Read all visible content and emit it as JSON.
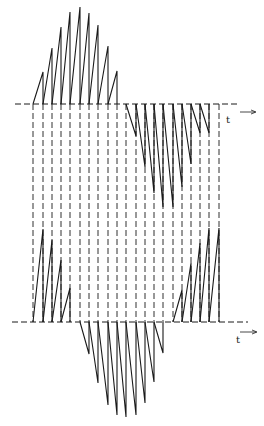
{
  "diagram": {
    "axis_label": "t",
    "colors": {
      "stroke": "#1a1a1a",
      "background": "#ffffff"
    },
    "top_axis": {
      "y": 104,
      "x_start": 15,
      "x_end": 240
    },
    "bottom_axis": {
      "y": 322,
      "x_start": 12,
      "x_end": 248
    },
    "vertical_lines_x": [
      33,
      43,
      52,
      61,
      70,
      80,
      89,
      98,
      108,
      117,
      126,
      136,
      145,
      154,
      163,
      173,
      182,
      191,
      200,
      209,
      219
    ],
    "top_positive_teeth": [
      {
        "x0": 33,
        "x1": 43,
        "peak_y": 72
      },
      {
        "x0": 43,
        "x1": 52,
        "peak_y": 48
      },
      {
        "x0": 52,
        "x1": 61,
        "peak_y": 27
      },
      {
        "x0": 61,
        "x1": 70,
        "peak_y": 12
      },
      {
        "x0": 70,
        "x1": 80,
        "peak_y": 7
      },
      {
        "x0": 80,
        "x1": 89,
        "peak_y": 13
      },
      {
        "x0": 89,
        "x1": 98,
        "peak_y": 25
      },
      {
        "x0": 98,
        "x1": 108,
        "peak_y": 46
      },
      {
        "x0": 108,
        "x1": 117,
        "peak_y": 71
      }
    ],
    "top_negative_teeth": [
      {
        "x0": 126,
        "x1": 136,
        "trough_y": 136
      },
      {
        "x0": 136,
        "x1": 145,
        "trough_y": 167
      },
      {
        "x0": 145,
        "x1": 154,
        "trough_y": 193
      },
      {
        "x0": 154,
        "x1": 163,
        "trough_y": 207
      },
      {
        "x0": 163,
        "x1": 173,
        "trough_y": 207
      },
      {
        "x0": 173,
        "x1": 182,
        "trough_y": 187
      },
      {
        "x0": 182,
        "x1": 191,
        "trough_y": 164
      },
      {
        "x0": 191,
        "x1": 200,
        "trough_y": 133
      },
      {
        "x0": 200,
        "x1": 209,
        "trough_y": 133
      }
    ],
    "bottom_positive_teeth": [
      {
        "x0": 33,
        "x1": 43,
        "peak_y": 229
      },
      {
        "x0": 43,
        "x1": 52,
        "peak_y": 240
      },
      {
        "x0": 52,
        "x1": 61,
        "peak_y": 260
      },
      {
        "x0": 61,
        "x1": 70,
        "peak_y": 288
      },
      {
        "x0": 173,
        "x1": 182,
        "peak_y": 290
      },
      {
        "x0": 182,
        "x1": 191,
        "peak_y": 263
      },
      {
        "x0": 191,
        "x1": 200,
        "peak_y": 243
      },
      {
        "x0": 200,
        "x1": 209,
        "peak_y": 228
      },
      {
        "x0": 209,
        "x1": 219,
        "peak_y": 228
      }
    ],
    "bottom_negative_teeth": [
      {
        "x0": 80,
        "x1": 89,
        "trough_y": 354
      },
      {
        "x0": 89,
        "x1": 98,
        "trough_y": 383
      },
      {
        "x0": 98,
        "x1": 108,
        "trough_y": 405
      },
      {
        "x0": 108,
        "x1": 117,
        "trough_y": 415
      },
      {
        "x0": 117,
        "x1": 126,
        "trough_y": 417
      },
      {
        "x0": 126,
        "x1": 136,
        "trough_y": 415
      },
      {
        "x0": 136,
        "x1": 145,
        "trough_y": 403
      },
      {
        "x0": 145,
        "x1": 154,
        "trough_y": 382
      },
      {
        "x0": 154,
        "x1": 163,
        "trough_y": 353
      }
    ]
  }
}
